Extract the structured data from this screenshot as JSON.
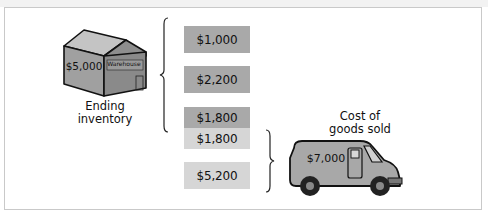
{
  "warehouse": {
    "value": "$5,000",
    "sign": "Warehouse",
    "caption_line1": "Ending",
    "caption_line2": "inventory"
  },
  "boxes": [
    {
      "value": "$1,000",
      "shade": "dark"
    },
    {
      "value": "$2,200",
      "shade": "dark"
    },
    {
      "value": "$1,800",
      "shade": "dark"
    },
    {
      "value": "$1,800",
      "shade": "light"
    },
    {
      "value": "$5,200",
      "shade": "light"
    }
  ],
  "truck": {
    "value": "$7,000",
    "caption_line1": "Cost of",
    "caption_line2": "goods sold"
  },
  "colors": {
    "dark_box": "#a9a9a9",
    "light_box": "#d6d6d6",
    "border": "#c9c9c9"
  }
}
